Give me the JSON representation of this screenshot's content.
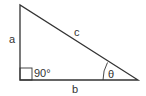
{
  "diagram": {
    "type": "right-triangle",
    "labels": {
      "side_a": "a",
      "side_b": "b",
      "side_c": "c",
      "right_angle": "90°",
      "angle": "θ"
    },
    "colors": {
      "stroke": "#333333",
      "text": "#333333",
      "background": "#ffffff"
    }
  }
}
